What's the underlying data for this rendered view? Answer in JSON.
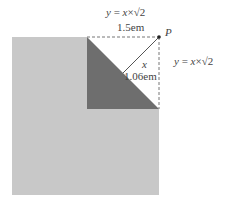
{
  "diagram": {
    "outer_square": {
      "color": "#c8c8c8"
    },
    "inner_square": {
      "fill": "#ffffff",
      "border": "dashed"
    },
    "triangle": {
      "color": "#6e6e6e"
    },
    "top_label": {
      "formula_lhs": "y",
      "formula_eq": " = ",
      "formula_var": "x",
      "formula_times": "×",
      "formula_root": "√2",
      "length": "1.5em"
    },
    "right_label": {
      "formula_lhs": "y",
      "formula_eq": " = ",
      "formula_var": "x",
      "formula_times": "×",
      "formula_root": "√2"
    },
    "point_label": "P",
    "diag_label": {
      "var": "x",
      "length": "1.06em"
    }
  }
}
